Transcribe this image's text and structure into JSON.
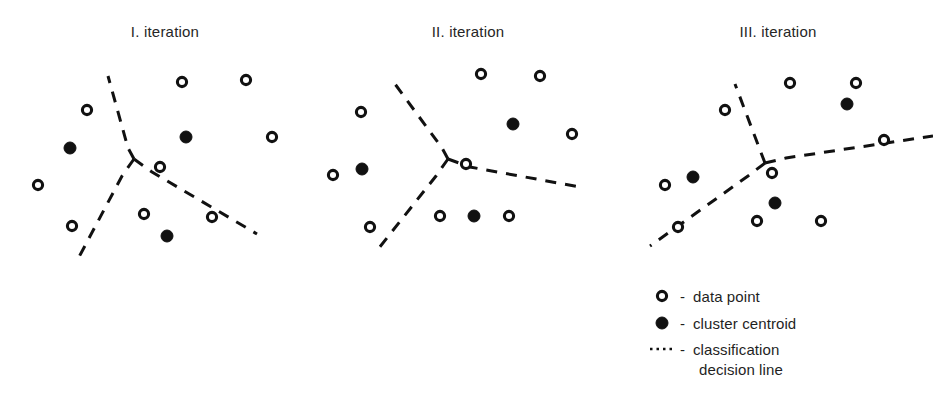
{
  "figure": {
    "type": "diagram",
    "background_color": "#ffffff",
    "ink_color": "#111111",
    "width": 933,
    "height": 404
  },
  "panels": [
    {
      "id": "panel-1",
      "title": "I. iteration",
      "title_x": 165,
      "title_y": 37,
      "data_points": [
        {
          "x": 87,
          "y": 110
        },
        {
          "x": 182,
          "y": 82
        },
        {
          "x": 246,
          "y": 80
        },
        {
          "x": 272,
          "y": 137
        },
        {
          "x": 38,
          "y": 185
        },
        {
          "x": 72,
          "y": 226
        },
        {
          "x": 160,
          "y": 167
        },
        {
          "x": 144,
          "y": 214
        },
        {
          "x": 212,
          "y": 217
        }
      ],
      "centroids": [
        {
          "x": 70,
          "y": 148
        },
        {
          "x": 186,
          "y": 137
        },
        {
          "x": 167,
          "y": 236
        }
      ],
      "junction": {
        "x": 134,
        "y": 159
      },
      "boundary_arms": [
        "M 134 159 L 128 148 L 108 76",
        "M 134 159 L 122 176 L 79 257",
        "M 134 159 L 152 172 L 257 234"
      ]
    },
    {
      "id": "panel-2",
      "title": "II. iteration",
      "title_x": 468,
      "title_y": 37,
      "data_points": [
        {
          "x": 481,
          "y": 74
        },
        {
          "x": 540,
          "y": 76
        },
        {
          "x": 572,
          "y": 134
        },
        {
          "x": 361,
          "y": 112
        },
        {
          "x": 333,
          "y": 175
        },
        {
          "x": 370,
          "y": 227
        },
        {
          "x": 440,
          "y": 216
        },
        {
          "x": 509,
          "y": 216
        },
        {
          "x": 466,
          "y": 164
        }
      ],
      "centroids": [
        {
          "x": 362,
          "y": 169
        },
        {
          "x": 513,
          "y": 124
        },
        {
          "x": 474,
          "y": 216
        }
      ],
      "junction": {
        "x": 448,
        "y": 159
      },
      "boundary_arms": [
        "M 448 159 L 442 148 L 395 84",
        "M 448 159 L 436 176 L 375 253",
        "M 448 159 L 470 167 L 580 187"
      ]
    },
    {
      "id": "panel-3",
      "title": "III. iteration",
      "title_x": 778,
      "title_y": 37,
      "data_points": [
        {
          "x": 790,
          "y": 83
        },
        {
          "x": 856,
          "y": 83
        },
        {
          "x": 884,
          "y": 140
        },
        {
          "x": 725,
          "y": 110
        },
        {
          "x": 665,
          "y": 185
        },
        {
          "x": 678,
          "y": 227
        },
        {
          "x": 757,
          "y": 221
        },
        {
          "x": 821,
          "y": 221
        },
        {
          "x": 772,
          "y": 173
        }
      ],
      "centroids": [
        {
          "x": 847,
          "y": 104
        },
        {
          "x": 693,
          "y": 177
        },
        {
          "x": 775,
          "y": 203
        }
      ],
      "junction": {
        "x": 765,
        "y": 163
      },
      "boundary_arms": [
        "M 765 163 L 760 150 L 735 84",
        "M 765 163 L 748 176 L 650 246",
        "M 765 163 L 786 158 L 933 136"
      ]
    }
  ],
  "legend": {
    "x": 655,
    "y": 295,
    "separator": "-",
    "items": [
      {
        "marker": "open-circle",
        "label": "data point"
      },
      {
        "marker": "filled-circle",
        "label": "cluster centroid"
      },
      {
        "marker": "dotted-line",
        "label": "classification",
        "label2": "decision line"
      }
    ]
  }
}
